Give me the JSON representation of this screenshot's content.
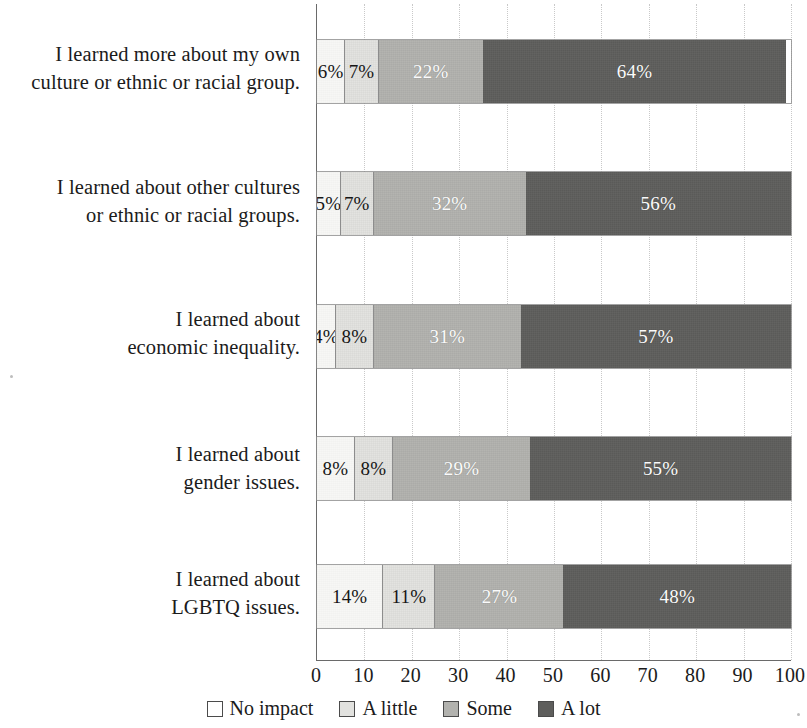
{
  "chart_data": {
    "type": "bar",
    "subtype": "horizontal-stacked-percent",
    "title": "",
    "subtitle": "",
    "xlabel": "",
    "ylabel": "",
    "xlim": [
      0,
      100
    ],
    "xticks": [
      "0",
      "10",
      "20",
      "30",
      "40",
      "50",
      "60",
      "70",
      "80",
      "90",
      "100"
    ],
    "grid": true,
    "legend_position": "bottom",
    "categories": [
      "I learned more about my own culture or ethnic or racial group.",
      "I learned about other cultures or ethnic or racial groups.",
      "I learned about economic inequality.",
      "I learned about gender issues.",
      "I learned about LGBTQ issues."
    ],
    "series": [
      {
        "name": "No impact",
        "color": "#ffffff",
        "values": [
          6,
          5,
          4,
          8,
          14
        ]
      },
      {
        "name": "A little",
        "color": "#e2e2df",
        "values": [
          7,
          7,
          8,
          8,
          11
        ]
      },
      {
        "name": "Some",
        "color": "#b2b2ae",
        "values": [
          22,
          32,
          31,
          29,
          27
        ]
      },
      {
        "name": "A lot",
        "color": "#5e5e5c",
        "values": [
          64,
          56,
          57,
          55,
          48
        ]
      }
    ],
    "data_labels": [
      [
        "6%",
        "7%",
        "22%",
        "64%"
      ],
      [
        "5%",
        "7%",
        "32%",
        "56%"
      ],
      [
        "4%",
        "8%",
        "31%",
        "57%"
      ],
      [
        "8%",
        "8%",
        "29%",
        "55%"
      ],
      [
        "14%",
        "11%",
        "27%",
        "48%"
      ]
    ]
  },
  "category_lines": [
    [
      "I learned more about my own",
      "culture or ethnic or racial group."
    ],
    [
      "I learned about other cultures",
      "or ethnic or racial groups."
    ],
    [
      "I learned about",
      "economic inequality."
    ],
    [
      "I learned about",
      "gender issues."
    ],
    [
      "I learned about",
      "LGBTQ issues."
    ]
  ],
  "legend": {
    "items": [
      {
        "label": "No impact"
      },
      {
        "label": "A little"
      },
      {
        "label": "Some"
      },
      {
        "label": "A lot"
      }
    ]
  }
}
